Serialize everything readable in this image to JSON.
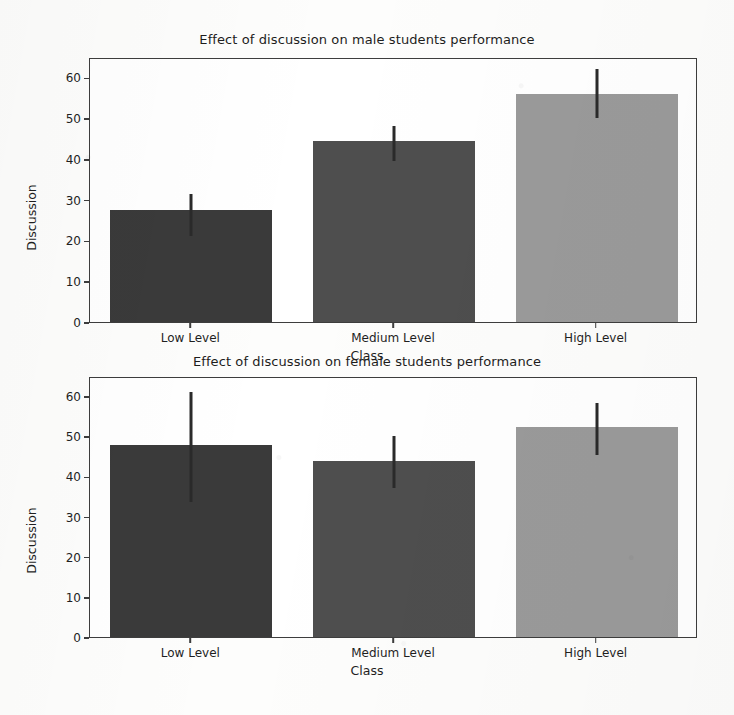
{
  "figure": {
    "background_color": "#fdfdfc",
    "axis_color": "#3d3d3d"
  },
  "chart_data": [
    {
      "type": "bar",
      "title": "Effect of discussion on male students performance",
      "xlabel": "Class",
      "ylabel": "Discussion",
      "categories": [
        "Low Level",
        "Medium Level",
        "High Level"
      ],
      "values": [
        27.5,
        44.3,
        56.0
      ],
      "errors_low": [
        21.5,
        40.0,
        50.5
      ],
      "errors_high": [
        32.0,
        48.5,
        62.5
      ],
      "colors": [
        "#3a3a3a",
        "#4e4e4e",
        "#9a9a9a"
      ],
      "ylim": [
        0,
        65
      ],
      "yticks": [
        0,
        10,
        20,
        30,
        40,
        50,
        60
      ],
      "ytick_labels": [
        "0",
        "10",
        "20",
        "30",
        "40",
        "50",
        "60"
      ],
      "grid": false,
      "legend": "none"
    },
    {
      "type": "bar",
      "title": "Effect of discussion on female students performance",
      "xlabel": "Class",
      "ylabel": "Discussion",
      "categories": [
        "Low Level",
        "Medium Level",
        "High Level"
      ],
      "values": [
        47.8,
        43.8,
        52.4
      ],
      "errors_low": [
        34.0,
        37.5,
        45.8
      ],
      "errors_high": [
        61.5,
        50.5,
        58.8
      ],
      "colors": [
        "#3a3a3a",
        "#4e4e4e",
        "#9a9a9a"
      ],
      "ylim": [
        0,
        65
      ],
      "yticks": [
        0,
        10,
        20,
        30,
        40,
        50,
        60
      ],
      "ytick_labels": [
        "0",
        "10",
        "20",
        "30",
        "40",
        "50",
        "60"
      ],
      "grid": false,
      "legend": "none"
    }
  ]
}
